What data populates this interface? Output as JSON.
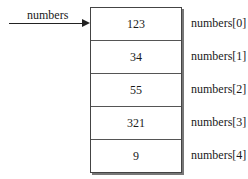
{
  "pointer": {
    "label": "numbers",
    "icon": "arrow-right-icon"
  },
  "array": {
    "cells": [
      {
        "value": "123",
        "index_label": "numbers[0]"
      },
      {
        "value": "34",
        "index_label": "numbers[1]"
      },
      {
        "value": "55",
        "index_label": "numbers[2]"
      },
      {
        "value": "321",
        "index_label": "numbers[3]"
      },
      {
        "value": "9",
        "index_label": "numbers[4]"
      }
    ]
  }
}
